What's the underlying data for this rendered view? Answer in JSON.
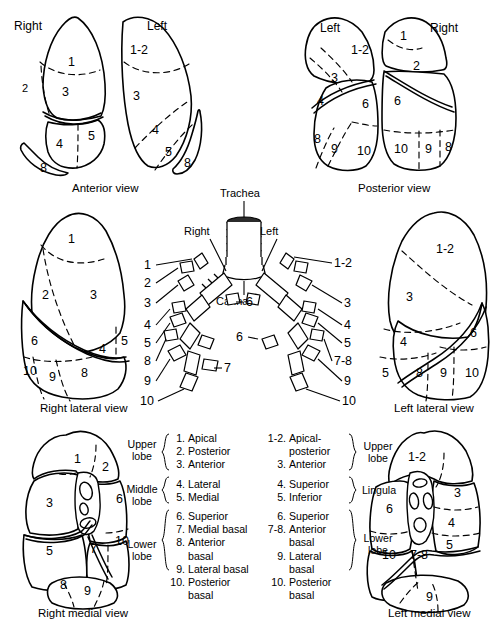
{
  "figure": {
    "line_color": "#000000",
    "background": "#ffffff"
  },
  "views": {
    "anterior": {
      "caption": "Anterior view",
      "right_label": "Right",
      "left_label": "Left",
      "right_segments": [
        "1",
        "2",
        "3",
        "4",
        "5",
        "8"
      ],
      "left_segments": [
        "1-2",
        "3",
        "4",
        "5",
        "8"
      ]
    },
    "posterior": {
      "caption": "Posterior view",
      "left_label": "Left",
      "right_label": "Right",
      "left_segments": [
        "1-2",
        "3",
        "4",
        "6",
        "8",
        "9",
        "10"
      ],
      "right_segments": [
        "1",
        "2",
        "6",
        "10",
        "9",
        "8"
      ]
    },
    "right_lateral": {
      "caption": "Right lateral view",
      "segments": [
        "1",
        "2",
        "3",
        "6",
        "4",
        "5",
        "10",
        "9",
        "8"
      ]
    },
    "left_lateral": {
      "caption": "Left lateral view",
      "segments": [
        "1-2",
        "3",
        "4",
        "5",
        "6",
        "8",
        "9",
        "10"
      ]
    },
    "right_medial": {
      "caption": "Right medial view",
      "segments": [
        "1",
        "2",
        "3",
        "6",
        "5",
        "7",
        "10",
        "8",
        "9"
      ]
    },
    "left_medial": {
      "caption": "Left medial view",
      "segments": [
        "1-2",
        "3",
        "6",
        "4",
        "5",
        "10",
        "7-8",
        "9"
      ]
    }
  },
  "bronchial_tree": {
    "trachea_label": "Trachea",
    "carina_label": "Carina",
    "right_label": "Right",
    "left_label": "Left",
    "right_side_numbers": [
      "1",
      "2",
      "3",
      "4",
      "5",
      "8",
      "9",
      "10"
    ],
    "right_inner_numbers": [
      "6",
      "7"
    ],
    "left_side_numbers": [
      "1-2",
      "3",
      "4",
      "5",
      "7-8",
      "9",
      "10"
    ],
    "left_inner_numbers": [
      "6"
    ]
  },
  "legend": {
    "right_lung": {
      "lobes": [
        {
          "name": "Upper lobe",
          "line1": "Upper",
          "line2": "lobe"
        },
        {
          "name": "Middle lobe",
          "line1": "Middle",
          "line2": "lobe"
        },
        {
          "name": "Lower lobe",
          "line1": "Lower",
          "line2": "lobe"
        }
      ],
      "upper": [
        {
          "num": "1.",
          "text": "Apical"
        },
        {
          "num": "2.",
          "text": "Posterior"
        },
        {
          "num": "3.",
          "text": "Anterior"
        }
      ],
      "middle": [
        {
          "num": "4.",
          "text": "Lateral"
        },
        {
          "num": "5.",
          "text": "Medial"
        }
      ],
      "lower": [
        {
          "num": "6.",
          "text": "Superior"
        },
        {
          "num": "7.",
          "text": "Medial basal"
        },
        {
          "num": "8.",
          "text": "Anterior",
          "cont": "basal"
        },
        {
          "num": "9.",
          "text": "Lateral basal"
        },
        {
          "num": "10.",
          "text": "Posterior",
          "cont": "basal"
        }
      ]
    },
    "left_lung": {
      "lobes": [
        {
          "name": "Upper lobe",
          "line1": "Upper",
          "line2": "lobe"
        },
        {
          "name": "Lingula",
          "line1": "Lingula",
          "line2": ""
        },
        {
          "name": "Lower lobe",
          "line1": "Lower",
          "line2": "lobe"
        }
      ],
      "upper": [
        {
          "num": "1-2.",
          "text": "Apical-",
          "cont": "posterior"
        },
        {
          "num": "3.",
          "text": "Anterior"
        }
      ],
      "lingula": [
        {
          "num": "4.",
          "text": "Superior"
        },
        {
          "num": "5.",
          "text": "Inferior"
        }
      ],
      "lower": [
        {
          "num": "6.",
          "text": "Superior"
        },
        {
          "num": "7-8.",
          "text": "Anterior",
          "cont": "basal"
        },
        {
          "num": "9.",
          "text": "Lateral",
          "cont": "basal"
        },
        {
          "num": "10.",
          "text": "Posterior",
          "cont": "basal"
        }
      ]
    }
  }
}
